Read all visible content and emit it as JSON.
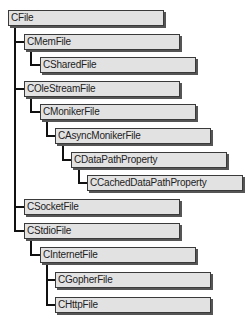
{
  "diagram": {
    "nodes": [
      {
        "id": "cfile",
        "label": "CFile",
        "x": 8,
        "y": 10,
        "depth": 0
      },
      {
        "id": "cmemfile",
        "label": "CMemFile",
        "x": 24,
        "y": 34,
        "depth": 1
      },
      {
        "id": "csharedfile",
        "label": "CSharedFile",
        "x": 40,
        "y": 57,
        "depth": 2
      },
      {
        "id": "colestreamfile",
        "label": "COleStreamFile",
        "x": 24,
        "y": 81,
        "depth": 1
      },
      {
        "id": "cmonikerfile",
        "label": "CMonikerFile",
        "x": 40,
        "y": 104,
        "depth": 2
      },
      {
        "id": "casyncmonikerfile",
        "label": "CAsyncMonikerFile",
        "x": 55,
        "y": 128,
        "depth": 3
      },
      {
        "id": "cdatapathproperty",
        "label": "CDataPathProperty",
        "x": 71,
        "y": 152,
        "depth": 4
      },
      {
        "id": "ccacheddatapathproperty",
        "label": "CCachedDataPathProperty",
        "x": 87,
        "y": 175,
        "depth": 5
      },
      {
        "id": "csocketfile",
        "label": "CSocketFile",
        "x": 24,
        "y": 199,
        "depth": 1
      },
      {
        "id": "cstdiofile",
        "label": "CStdioFile",
        "x": 24,
        "y": 223,
        "depth": 1
      },
      {
        "id": "cinternetfile",
        "label": "CInternetFile",
        "x": 40,
        "y": 247,
        "depth": 2
      },
      {
        "id": "cgopherfile",
        "label": "CGopherFile",
        "x": 55,
        "y": 272,
        "depth": 3
      },
      {
        "id": "chttpfile",
        "label": "CHttpFile",
        "x": 55,
        "y": 297,
        "depth": 3
      }
    ],
    "edges": [
      [
        "cfile",
        "cmemfile"
      ],
      [
        "cmemfile",
        "csharedfile"
      ],
      [
        "cfile",
        "colestreamfile"
      ],
      [
        "colestreamfile",
        "cmonikerfile"
      ],
      [
        "cmonikerfile",
        "casyncmonikerfile"
      ],
      [
        "casyncmonikerfile",
        "cdatapathproperty"
      ],
      [
        "cdatapathproperty",
        "ccacheddatapathproperty"
      ],
      [
        "cfile",
        "csocketfile"
      ],
      [
        "cfile",
        "cstdiofile"
      ],
      [
        "cstdiofile",
        "cinternetfile"
      ],
      [
        "cinternetfile",
        "cgopherfile"
      ],
      [
        "cinternetfile",
        "chttpfile"
      ]
    ],
    "colors": {
      "box_fill": "#e2e2e2",
      "border": "#3a3a3a",
      "connector": "#111111"
    }
  }
}
